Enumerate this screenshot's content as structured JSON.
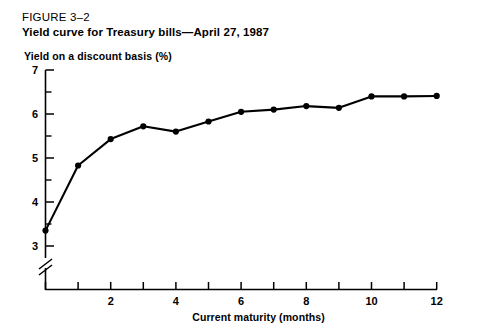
{
  "figure": {
    "label": "FIGURE 3–2",
    "title": "Yield curve for Treasury bills—April 27, 1987"
  },
  "chart_data": {
    "type": "line",
    "title": "Yield curve for Treasury bills—April 27, 1987",
    "xlabel": "Current maturity (months)",
    "ylabel": "Yield on a discount basis (%)",
    "x": [
      0,
      1,
      2,
      3,
      4,
      5,
      6,
      7,
      8,
      9,
      10,
      11,
      12
    ],
    "values": [
      3.35,
      4.83,
      5.43,
      5.72,
      5.6,
      5.83,
      6.05,
      6.1,
      6.18,
      6.14,
      6.4,
      6.4,
      6.41
    ],
    "series": [
      {
        "name": "Yield on a discount basis (%)",
        "values": [
          3.35,
          4.83,
          5.43,
          5.72,
          5.6,
          5.83,
          6.05,
          6.1,
          6.18,
          6.14,
          6.4,
          6.4,
          6.41
        ]
      }
    ],
    "xlim": [
      0,
      12
    ],
    "ylim": [
      3,
      7
    ],
    "xticks": [
      0,
      1,
      2,
      3,
      4,
      5,
      6,
      7,
      8,
      9,
      10,
      11,
      12
    ],
    "xticklabels": [
      "",
      "",
      "2",
      "",
      "4",
      "",
      "6",
      "",
      "8",
      "",
      "10",
      "",
      "12"
    ],
    "yticks": [
      3,
      3.5,
      4,
      4.5,
      5,
      5.5,
      6,
      6.5,
      7
    ],
    "yticklabels": [
      "3",
      "",
      "4",
      "",
      "5",
      "",
      "6",
      "",
      "7"
    ],
    "grid": false,
    "legend": "none",
    "marker": "filled-circle",
    "line_color": "#000000",
    "axis_break": "y-axis break below 3",
    "annotations": []
  },
  "axis": {
    "y_labels": [
      "7",
      "6",
      "5",
      "4",
      "3"
    ],
    "x_labels": [
      "2",
      "4",
      "6",
      "8",
      "10",
      "12"
    ]
  }
}
